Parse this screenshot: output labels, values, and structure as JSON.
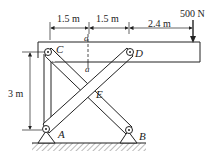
{
  "diagram": {
    "type": "frame-mechanics",
    "dimensions": {
      "horizontal": [
        "1.5 m",
        "1.5 m",
        "2.4 m"
      ],
      "vertical": "3 m"
    },
    "load": {
      "label": "500 N",
      "direction": "down"
    },
    "points": {
      "A": "A",
      "B": "B",
      "C": "C",
      "D": "D",
      "E": "E"
    },
    "section": {
      "top": "a",
      "bottom": "a"
    }
  }
}
